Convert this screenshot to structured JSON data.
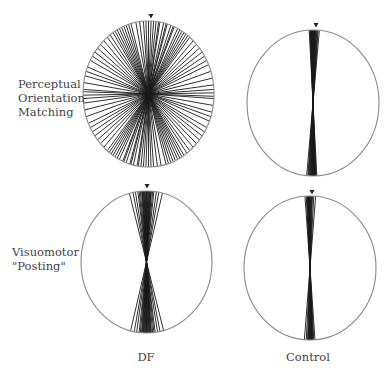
{
  "figure": {
    "row_labels": [
      {
        "line1": "Perceptual",
        "line2": "Orientation",
        "line3": "Matching"
      },
      {
        "line1": "Visuomotor",
        "line2": "\"Posting\"",
        "line3": ""
      }
    ],
    "column_labels": [
      "DF",
      "Control"
    ],
    "stroke_color": "#1a1a1a",
    "outline_color": "#8a8a8a",
    "panels": [
      {
        "id": "df-perceptual",
        "cx": 148.5,
        "cy": 94,
        "rx": 65.5,
        "ry": 73,
        "marker": {
          "x": 151,
          "y": 16
        },
        "angles_deg": [
          -88,
          -86,
          -80,
          -74,
          -70,
          -66,
          -60,
          -56,
          -52,
          -48,
          -44,
          -40,
          -36,
          -33,
          -30,
          -26,
          -22,
          -18,
          -14,
          -10,
          -7,
          -4,
          -2,
          0,
          2,
          4,
          6,
          9,
          12,
          15,
          18,
          21,
          24,
          28,
          32,
          36,
          40,
          44,
          48,
          52,
          56,
          60,
          64,
          70,
          76,
          82,
          86,
          89,
          -24,
          -20,
          20,
          26,
          30,
          34,
          -28,
          -16,
          14,
          8
        ]
      },
      {
        "id": "control-perceptual",
        "cx": 313,
        "cy": 103,
        "rx": 66,
        "ry": 73,
        "marker": {
          "x": 316,
          "y": 25
        },
        "angles_deg": [
          -3,
          -2.5,
          -2,
          -1.8,
          -1.5,
          -1.2,
          -1,
          -0.8,
          -0.5,
          -0.3,
          0,
          0.3,
          0.5,
          0.8,
          1,
          1.3,
          1.6,
          2,
          2.4,
          3,
          3.5,
          4,
          5
        ]
      },
      {
        "id": "df-visuomotor",
        "cx": 146.5,
        "cy": 262,
        "rx": 65.5,
        "ry": 71,
        "marker": {
          "x": 147,
          "y": 186
        },
        "angles_deg": [
          -14,
          -11,
          -9,
          -7,
          -6,
          -5,
          -4,
          -3.5,
          -3,
          -2.5,
          -2,
          -1.5,
          -1,
          -0.5,
          0,
          0.5,
          1,
          1.5,
          2,
          2.5,
          3,
          3.5,
          4,
          5,
          6,
          8,
          10,
          13
        ]
      },
      {
        "id": "control-visuomotor",
        "cx": 310,
        "cy": 268,
        "rx": 66,
        "ry": 72,
        "marker": {
          "x": 312,
          "y": 192
        },
        "angles_deg": [
          -4,
          -3,
          -2.5,
          -2,
          -1.8,
          -1.5,
          -1.2,
          -1,
          -0.8,
          -0.5,
          -0.2,
          0,
          0.3,
          0.6,
          1,
          1.4,
          2,
          3,
          4.5
        ]
      }
    ]
  }
}
